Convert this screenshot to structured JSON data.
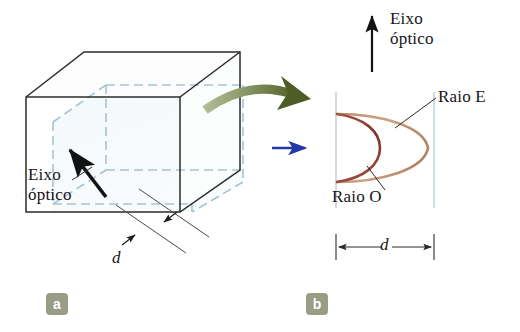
{
  "figure": {
    "background_color": "#ffffff",
    "width": 520,
    "height": 332
  },
  "panel_a": {
    "badge": "a",
    "optical_axis_label_line1": "Eixo",
    "optical_axis_label_line2": "óptico",
    "thickness_label": "d",
    "crystal_edge_color": "#262626",
    "slab_dash_color": "#a8c4d4",
    "slab_fill_color": "#eef5f9",
    "axis_arrow_color": "#111111",
    "green_arrow_color": "#6b7a41"
  },
  "panel_b": {
    "badge": "b",
    "optical_axis_label_line1": "Eixo",
    "optical_axis_label_line2": "óptico",
    "ray_e_label": "Raio E",
    "ray_o_label": "Raio O",
    "thickness_label": "d",
    "boundary_line_color": "#b9cdd9",
    "wavefront_e_color": "#c79a76",
    "wavefront_o_color": "#8f3c32",
    "incoming_ray_color": "#2a3fa8",
    "axis_arrow_color": "#111111",
    "dimension_line_color": "#2a2a2a"
  },
  "icons": {
    "optical_axis_arrow": "up-arrow-icon",
    "incident_ray_arrow": "right-arrow-icon",
    "transition_arrow": "curved-green-arrow-icon",
    "thickness_dimension": "double-headed-arrow-icon"
  }
}
